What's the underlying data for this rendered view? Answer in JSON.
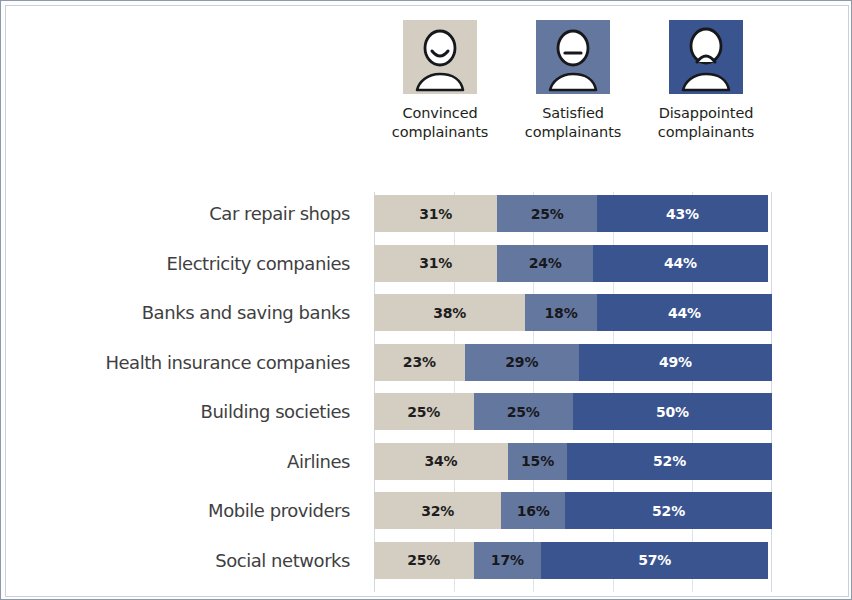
{
  "legend": {
    "columns": [
      {
        "label_line1": "Convinced",
        "label_line2": "complainants",
        "icon": "person-smile-icon",
        "bg": "#d4cec2",
        "face": "smile"
      },
      {
        "label_line1": "Satisfied",
        "label_line2": "complainants",
        "icon": "person-neutral-icon",
        "bg": "#64789f",
        "face": "neutral"
      },
      {
        "label_line1": "Disappointed",
        "label_line2": "complainants",
        "icon": "person-frown-icon",
        "bg": "#3a5490",
        "face": "frown"
      }
    ]
  },
  "colors": {
    "convinced": "#d4cec2",
    "satisfied": "#64789f",
    "disappointed": "#3a5490",
    "gridline": "#dfe3ea",
    "border": "#8d99ab",
    "label_text": "#3f3f42"
  },
  "chart_data": {
    "type": "bar",
    "orientation": "horizontal",
    "stacked": true,
    "normalized_percent": true,
    "title": "",
    "xlabel": "",
    "ylabel": "",
    "xlim": [
      0,
      100
    ],
    "grid": true,
    "gridline_interval": 20,
    "legend_position": "top",
    "value_suffix": "%",
    "categories": [
      "Car repair shops",
      "Electricity companies",
      "Banks and saving banks",
      "Health insurance companies",
      "Building societies",
      "Airlines",
      "Mobile providers",
      "Social networks"
    ],
    "series": [
      {
        "name": "Convinced complainants",
        "color": "#d4cec2",
        "values": [
          31,
          31,
          38,
          23,
          25,
          34,
          32,
          25
        ]
      },
      {
        "name": "Satisfied complainants",
        "color": "#64789f",
        "values": [
          25,
          24,
          18,
          29,
          25,
          15,
          16,
          17
        ]
      },
      {
        "name": "Disappointed complainants",
        "color": "#3a5490",
        "values": [
          43,
          44,
          44,
          49,
          50,
          52,
          52,
          57
        ]
      }
    ],
    "labels": [
      [
        "31%",
        "25%",
        "43%"
      ],
      [
        "31%",
        "24%",
        "44%"
      ],
      [
        "38%",
        "18%",
        "44%"
      ],
      [
        "23%",
        "29%",
        "49%"
      ],
      [
        "25%",
        "25%",
        "50%"
      ],
      [
        "34%",
        "15%",
        "52%"
      ],
      [
        "32%",
        "16%",
        "52%"
      ],
      [
        "25%",
        "17%",
        "57%"
      ]
    ]
  }
}
